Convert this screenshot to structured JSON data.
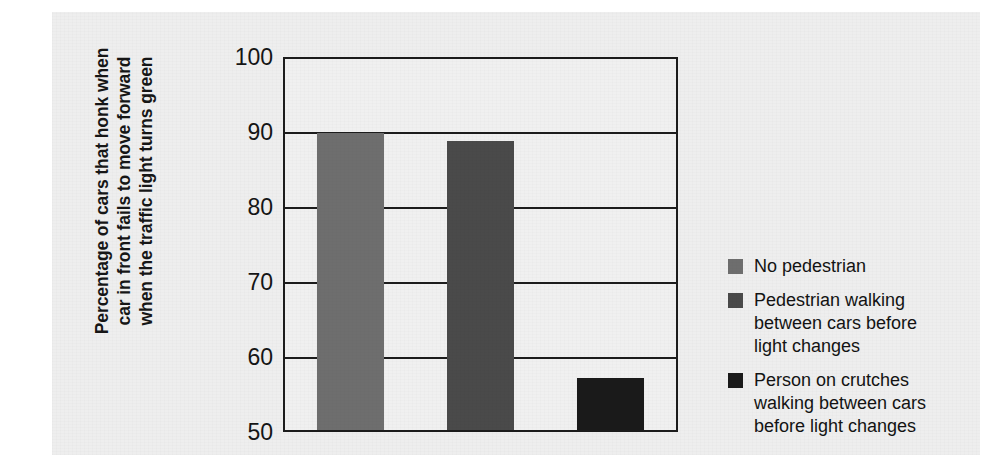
{
  "chart_data": {
    "type": "bar",
    "title": "",
    "subtitle": "",
    "xlabel": "",
    "ylabel": "Percentage of cars that honk when\ncar in front fails to move forward\nwhen the traffic light turns green",
    "categories": [
      "No pedestrian",
      "Pedestrian walking between cars before light changes",
      "Person on crutches walking between cars before light changes"
    ],
    "values": [
      90,
      89,
      57
    ],
    "ylim": [
      50,
      100
    ],
    "yticks": [
      100,
      90,
      80,
      70,
      60,
      50
    ],
    "ytick_labels": [
      "100",
      "90",
      "80",
      "70",
      "60",
      "50"
    ],
    "grid": true,
    "grid_axis": "y",
    "legend_position": "right",
    "bar_colors": [
      "#6e6e6e",
      "#4a4a4a",
      "#1a1a1a"
    ],
    "legend": [
      {
        "label": "No pedestrian",
        "color": "#6e6e6e"
      },
      {
        "label": "Pedestrian walking\nbetween cars before\nlight changes",
        "color": "#4a4a4a"
      },
      {
        "label": "Person on crutches\nwalking between cars\nbefore light changes",
        "color": "#1a1a1a"
      }
    ],
    "axis_color": "#1c1c1c",
    "plot_background": "#f0f0f0",
    "figure_background": "#eeeeee"
  }
}
